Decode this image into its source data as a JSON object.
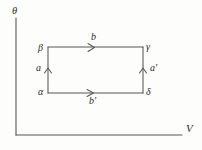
{
  "figure": {
    "type": "thermodynamic-cycle-diagram",
    "axes": {
      "y_label": "θ",
      "x_label": "V",
      "origin": {
        "x": 16,
        "y": 135
      },
      "y_top": {
        "x": 16,
        "y": 18
      },
      "x_right": {
        "x": 182,
        "y": 135
      }
    },
    "cycle": {
      "rect": {
        "left": 48,
        "top": 47,
        "right": 143,
        "bottom": 93
      },
      "vertices": [
        {
          "name": "beta",
          "label": "β",
          "corner": "top-left"
        },
        {
          "name": "gamma",
          "label": "γ",
          "corner": "top-right"
        },
        {
          "name": "delta",
          "label": "δ",
          "corner": "bottom-right"
        },
        {
          "name": "alpha",
          "label": "α",
          "corner": "bottom-left"
        }
      ],
      "edges": [
        {
          "name": "top",
          "label": "b",
          "direction": "right",
          "from": "beta",
          "to": "gamma"
        },
        {
          "name": "bottom",
          "label": "b'",
          "direction": "right",
          "from": "alpha",
          "to": "delta"
        },
        {
          "name": "left",
          "label": "a",
          "direction": "up",
          "from": "alpha",
          "to": "beta"
        },
        {
          "name": "right",
          "label": "a'",
          "direction": "up",
          "from": "delta",
          "to": "gamma"
        }
      ]
    },
    "colors": {
      "background": "#fdfdfb",
      "line": "#57575a",
      "text": "#2b2b2b"
    }
  }
}
